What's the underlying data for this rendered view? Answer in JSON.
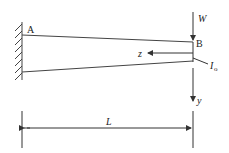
{
  "diagram": {
    "labels": {
      "A": "A",
      "B": "B",
      "W": "W",
      "z": "z",
      "y": "y",
      "I0": "I",
      "I0_sub": "o",
      "L": "L"
    },
    "colors": {
      "line": "#333333",
      "background": "#ffffff"
    }
  }
}
